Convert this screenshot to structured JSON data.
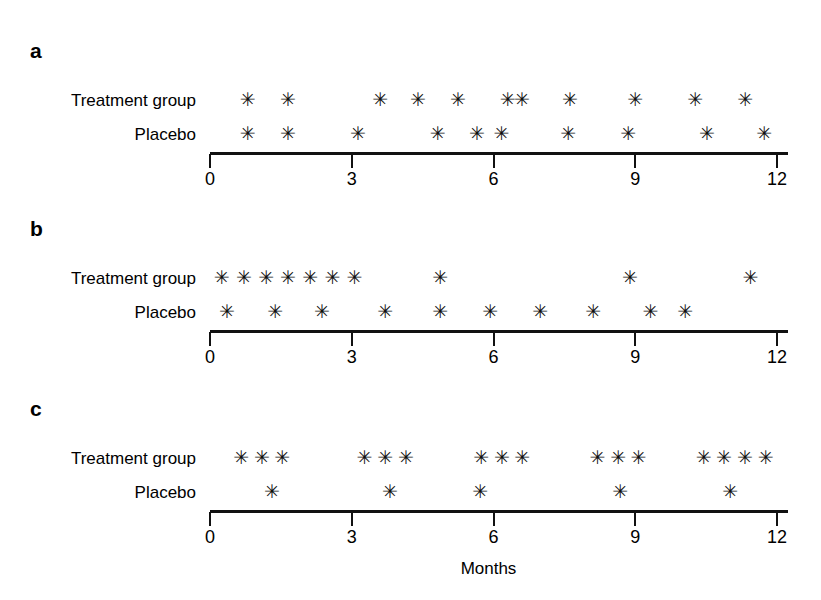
{
  "figure": {
    "background": "#ffffff",
    "ink_color": "#111111",
    "marker_glyph": "✳",
    "axis_title": "Months"
  },
  "chart_data": {
    "type": "scatter",
    "title": "",
    "xlabel": "Months",
    "ylabel": "",
    "xlim": [
      0,
      12
    ],
    "xticks": [
      0,
      3,
      6,
      9,
      12
    ],
    "xtick_labels": [
      "0",
      "3",
      "6",
      "9",
      "12"
    ],
    "grid": false,
    "legend_position": "row-labels-left",
    "marker": "asterisk",
    "note": "Event timeline strip plot; each asterisk marks one event occurrence in months since baseline.",
    "panels": [
      {
        "letter": "a",
        "series": [
          {
            "name": "Treatment group",
            "count": 10,
            "x": [
              0.8,
              1.65,
              3.6,
              4.4,
              5.25,
              6.6,
              6.3,
              7.62,
              9.0,
              10.27,
              11.33
            ]
          },
          {
            "name": "Placebo",
            "count": 11,
            "x": [
              0.8,
              1.65,
              3.13,
              4.82,
              5.65,
              6.17,
              7.58,
              8.85,
              10.52,
              11.73
            ]
          }
        ]
      },
      {
        "letter": "b",
        "series": [
          {
            "name": "Treatment group",
            "count": 10,
            "x": [
              0.25,
              0.72,
              1.19,
              1.65,
              2.12,
              2.59,
              3.06,
              4.87,
              8.89,
              11.44
            ]
          },
          {
            "name": "Placebo",
            "count": 10,
            "x": [
              0.36,
              1.38,
              2.37,
              3.71,
              4.87,
              5.93,
              6.99,
              8.11,
              9.32,
              10.06
            ]
          }
        ]
      },
      {
        "letter": "c",
        "series": [
          {
            "name": "Treatment group",
            "count": 16,
            "x": [
              0.66,
              1.1,
              1.53,
              3.27,
              3.71,
              4.15,
              5.74,
              6.18,
              6.61,
              8.2,
              8.64,
              9.07,
              10.45,
              10.88,
              11.32,
              11.76
            ]
          },
          {
            "name": "Placebo",
            "count": 5,
            "x": [
              1.31,
              3.81,
              5.72,
              8.68,
              11.01
            ]
          }
        ]
      }
    ]
  }
}
